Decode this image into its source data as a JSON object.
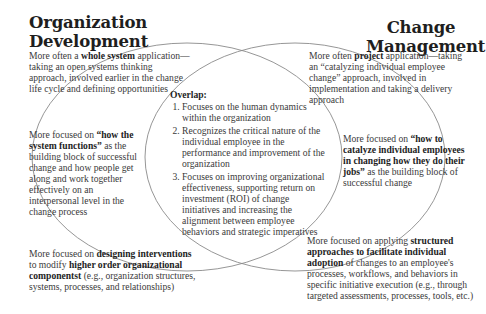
{
  "left_set": {
    "title_line1": "Organization",
    "title_line2": "Development",
    "top": {
      "pre": "More often a ",
      "bold": "whole system",
      "post": " application—taking an open systems thinking approach, involved earlier in the change life cycle and defining opportunities"
    },
    "middle": {
      "pre": "More focused on ",
      "bold": "“how the system functions”",
      "post": " as the building block of successful change and how people get along and work together effectively on an interpersonal level in the change process"
    },
    "bottom": {
      "pre": "More focused on ",
      "bold1": "designing interventions",
      "mid": " to modify ",
      "bold2": "higher order organizational componentst",
      "post": " (e.g., organization structures, systems, processes, and relationships)"
    }
  },
  "right_set": {
    "title_line1": "Change",
    "title_line2": "Management",
    "top": {
      "pre": "More often ",
      "bold": "project",
      "post": " application—taking an “catalyzing individual employee change” approach, involved in implementation and taking a delivery approach"
    },
    "middle": {
      "pre": "More focused on ",
      "bold": "“how to catalyze individual employees in changing how they do their jobs”",
      "post": " as the building block of successful change"
    },
    "bottom": {
      "pre": "More focused on applying ",
      "bold": "structured approaches to facilitate individual adoption",
      "post": " of changes to an employee's processes, workflows, and behaviors in specific initiative execution (e.g., through targeted assessments, processes, tools, etc.)"
    }
  },
  "overlap": {
    "title": "Overlap:",
    "items": [
      "Focuses on the human dynamics within the organization",
      "Recognizes the critical nature of the individual employee in the performance and improvement of the organization",
      "Focuses on improving organizational effectiveness, supporting return on investment (ROI) of change initiatives and increasing the alignment between employee behaviors and strategic imperatives"
    ]
  },
  "colors": {
    "outline": "#8a8a8a",
    "title_text": "#1e1e1e",
    "body_text": "#3a3a3a"
  }
}
